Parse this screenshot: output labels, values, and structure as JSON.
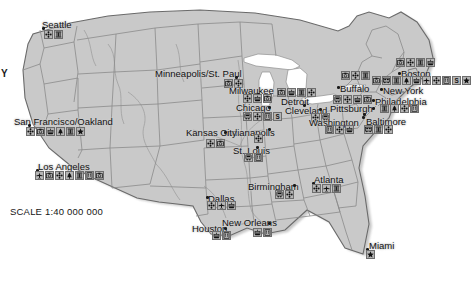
{
  "map": {
    "title": "United States city amenity map",
    "scale_label": "SCALE 1:40 000 000",
    "edge_label": "Y",
    "colors": {
      "land": "#c9c9c9",
      "land_shade": "#bdbdbd",
      "water": "#ffffff",
      "state_border": "#8a8a8a",
      "country_border": "#6a6a6a",
      "coast_shadow": "#9a9a9a",
      "icon_box": "#b5b5b5",
      "icon_border": "#6e6e6e",
      "label_text": "#121212"
    }
  },
  "legend_icon_names": [
    "airplane-icon",
    "camera-icon",
    "flower-icon",
    "boat-icon",
    "monument-icon",
    "building-icon",
    "star-icon",
    "bus-icon",
    "tree-icon",
    "museum-icon",
    "letter-s-icon",
    "train-icon"
  ],
  "cities": [
    {
      "name": "Seattle",
      "label_x": 42,
      "label_y": 20,
      "dot_x": 42,
      "dot_y": 27,
      "icons_x": 44,
      "icons_y": 30,
      "icons": [
        "flower-icon",
        "monument-icon"
      ]
    },
    {
      "name": "Minneapolis/St. Paul",
      "label_x": 155,
      "label_y": 69,
      "dot_x": 235,
      "dot_y": 76,
      "icons_x": 224,
      "icons_y": 79,
      "icons": [
        "camera-icon",
        "flower-icon"
      ]
    },
    {
      "name": "Milwaukee",
      "label_x": 229,
      "label_y": 86,
      "dot_x": 257,
      "dot_y": 93,
      "icons_x": 243,
      "icons_y": 94,
      "icons": [
        "flower-icon",
        "boat-icon",
        "camera-icon"
      ]
    },
    {
      "name": "Detroit",
      "label_x": 281,
      "label_y": 97,
      "dot_x": 303,
      "dot_y": 104,
      "icons_x": 277,
      "icons_y": 88,
      "icons": [
        "camera-icon",
        "boat-icon",
        "monument-icon",
        "flower-icon"
      ]
    },
    {
      "name": "Chicago",
      "label_x": 236,
      "label_y": 103,
      "dot_x": 268,
      "dot_y": 106,
      "icons_x": 243,
      "icons_y": 112,
      "icons": [
        "train-icon",
        "flower-icon",
        "building-icon",
        "letter-s-icon"
      ]
    },
    {
      "name": "Cleveland",
      "label_x": 285,
      "label_y": 106,
      "dot_x": 319,
      "dot_y": 108,
      "icons_x": 311,
      "icons_y": 113,
      "icons": [
        "flower-icon",
        "train-icon"
      ]
    },
    {
      "name": "Buffalo",
      "label_x": 340,
      "label_y": 84,
      "dot_x": 337,
      "dot_y": 86,
      "icons_x": 341,
      "icons_y": 71,
      "icons": [
        "camera-icon",
        "flower-icon",
        "monument-icon"
      ]
    },
    {
      "name": "Pittsburgh",
      "label_x": 330,
      "label_y": 104,
      "dot_x": 372,
      "dot_y": 107,
      "icons_x": 333,
      "icons_y": 95,
      "icons": [
        "train-icon",
        "flower-icon",
        "boat-icon",
        "camera-icon"
      ]
    },
    {
      "name": "Boston",
      "label_x": 401,
      "label_y": 69,
      "dot_x": 398,
      "dot_y": 72,
      "icons_x": 396,
      "icons_y": 58,
      "icons": [
        "camera-icon",
        "flower-icon",
        "monument-icon",
        "boat-icon"
      ]
    },
    {
      "name": "New York",
      "label_x": 383,
      "label_y": 86,
      "dot_x": 380,
      "dot_y": 88,
      "icons_x": 372,
      "icons_y": 76,
      "icons": [
        "camera-icon",
        "bus-icon",
        "monument-icon",
        "tree-icon",
        "boat-icon",
        "airplane-icon",
        "flower-icon",
        "building-icon",
        "letter-s-icon",
        "star-icon"
      ]
    },
    {
      "name": "Philadelphia",
      "label_x": 375,
      "label_y": 97,
      "dot_x": 372,
      "dot_y": 99,
      "icons_x": 380,
      "icons_y": 104,
      "icons": [
        "monument-icon",
        "tree-icon",
        "flower-icon",
        "building-icon"
      ]
    },
    {
      "name": "Washington",
      "label_x": 309,
      "label_y": 118,
      "dot_x": 362,
      "dot_y": 116,
      "icons_x": 325,
      "icons_y": 125,
      "icons": [
        "building-icon",
        "flower-icon",
        "boat-icon"
      ]
    },
    {
      "name": "Baltimore",
      "label_x": 366,
      "label_y": 117,
      "dot_x": 363,
      "dot_y": 113,
      "icons_x": 364,
      "icons_y": 125,
      "icons": [
        "bus-icon",
        "monument-icon",
        "flower-icon"
      ]
    },
    {
      "name": "Indianapolis",
      "label_x": 224,
      "label_y": 128,
      "dot_x": 268,
      "dot_y": 128,
      "icons_x": 254,
      "icons_y": 134,
      "icons": [
        "flower-icon"
      ]
    },
    {
      "name": "Kansas City",
      "label_x": 186,
      "label_y": 128,
      "dot_x": 224,
      "dot_y": 131,
      "icons_x": 206,
      "icons_y": 139,
      "icons": [
        "flower-icon",
        "camera-icon"
      ]
    },
    {
      "name": "St. Louis",
      "label_x": 233,
      "label_y": 146,
      "dot_x": 256,
      "dot_y": 146,
      "icons_x": 244,
      "icons_y": 153,
      "icons": [
        "train-icon",
        "building-icon"
      ]
    },
    {
      "name": "San Francisco/Oakland",
      "label_x": 14,
      "label_y": 117,
      "dot_x": 28,
      "dot_y": 124,
      "icons_x": 26,
      "icons_y": 127,
      "icons": [
        "flower-icon",
        "camera-icon",
        "boat-icon",
        "tree-icon",
        "monument-icon",
        "star-icon"
      ]
    },
    {
      "name": "Los Angeles",
      "label_x": 38,
      "label_y": 162,
      "dot_x": 36,
      "dot_y": 169,
      "icons_x": 35,
      "icons_y": 171,
      "icons": [
        "airplane-icon",
        "camera-icon",
        "flower-icon",
        "tree-icon",
        "monument-icon",
        "building-icon",
        "camera-icon"
      ]
    },
    {
      "name": "Dallas",
      "label_x": 208,
      "label_y": 194,
      "dot_x": 206,
      "dot_y": 196,
      "icons_x": 207,
      "icons_y": 201,
      "icons": [
        "flower-icon",
        "airplane-icon",
        "boat-icon"
      ]
    },
    {
      "name": "Houston",
      "label_x": 192,
      "label_y": 224,
      "dot_x": 224,
      "dot_y": 227,
      "icons_x": 212,
      "icons_y": 231,
      "icons": [
        "boat-icon",
        "building-icon"
      ]
    },
    {
      "name": "New Orleans",
      "label_x": 222,
      "label_y": 218,
      "dot_x": 268,
      "dot_y": 222,
      "icons_x": 253,
      "icons_y": 228,
      "icons": [
        "boat-icon",
        "building-icon"
      ]
    },
    {
      "name": "Birmingham",
      "label_x": 248,
      "label_y": 182,
      "dot_x": 293,
      "dot_y": 184,
      "icons_x": 275,
      "icons_y": 190,
      "icons": [
        "train-icon",
        "flower-icon"
      ]
    },
    {
      "name": "Atlanta",
      "label_x": 314,
      "label_y": 175,
      "dot_x": 312,
      "dot_y": 182,
      "icons_x": 312,
      "icons_y": 184,
      "icons": [
        "flower-icon",
        "airplane-icon",
        "monument-icon"
      ]
    },
    {
      "name": "Miami",
      "label_x": 369,
      "label_y": 241,
      "dot_x": 366,
      "dot_y": 248,
      "icons_x": 366,
      "icons_y": 250,
      "icons": [
        "star-icon"
      ]
    }
  ]
}
